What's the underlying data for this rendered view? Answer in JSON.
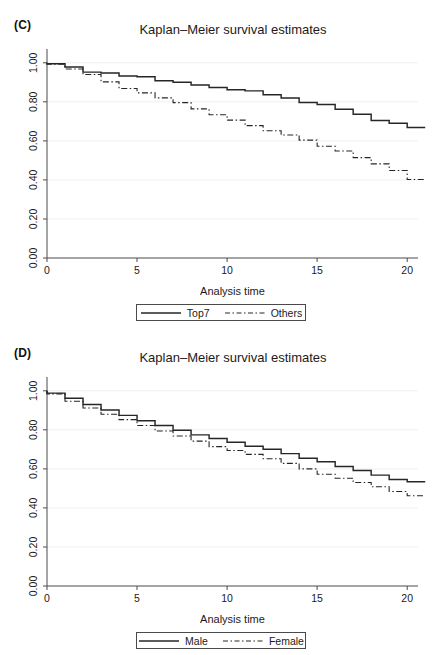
{
  "figure": {
    "background": "#ffffff",
    "line_color": "#262626",
    "grid_color": "#f0f0f0",
    "axis_color": "#4a4a4a"
  },
  "panels": [
    {
      "id": "C",
      "label": "(C)",
      "title": "Kaplan–Meier survival estimates",
      "legend": [
        {
          "label": "Top7",
          "style": "solid"
        },
        {
          "label": "Others",
          "style": "dashdot"
        }
      ]
    },
    {
      "id": "D",
      "label": "(D)",
      "title": "Kaplan–Meier survival estimates",
      "legend": [
        {
          "label": "Male",
          "style": "solid"
        },
        {
          "label": "Female",
          "style": "dashdot"
        }
      ]
    }
  ],
  "chart_data": [
    {
      "type": "line",
      "panel": "C",
      "title": "Kaplan–Meier survival estimates",
      "xlabel": "Analysis time",
      "ylabel": "",
      "xlim": [
        0,
        20.6
      ],
      "ylim": [
        0,
        1.05
      ],
      "xticks": [
        0,
        5,
        10,
        15,
        20
      ],
      "xtick_labels": [
        "0",
        "5",
        "10",
        "15",
        "20"
      ],
      "yticks": [
        0.0,
        0.2,
        0.4,
        0.6,
        0.8,
        1.0
      ],
      "ytick_labels": [
        "0.00",
        "0.20",
        "0.40",
        "0.60",
        "0.80",
        "1.00"
      ],
      "grid": "horizontal-faint",
      "legend_position": "below-axis-label",
      "step": "post",
      "series": [
        {
          "name": "Top7",
          "style": "solid",
          "x": [
            0,
            1,
            2,
            3,
            4,
            5,
            6,
            7,
            8,
            9,
            10,
            11,
            12,
            13,
            14,
            15,
            16,
            17,
            18,
            19,
            20
          ],
          "values": [
            1.0,
            0.995,
            0.978,
            0.952,
            0.948,
            0.932,
            0.928,
            0.908,
            0.9,
            0.886,
            0.873,
            0.862,
            0.856,
            0.836,
            0.82,
            0.797,
            0.786,
            0.762,
            0.736,
            0.704,
            0.69,
            0.668
          ]
        },
        {
          "name": "Others",
          "style": "dashdot",
          "x": [
            0,
            1,
            2,
            3,
            4,
            5,
            6,
            7,
            8,
            9,
            10,
            11,
            12,
            13,
            14,
            15,
            16,
            17,
            18,
            19,
            20
          ],
          "values": [
            1.0,
            0.993,
            0.968,
            0.94,
            0.902,
            0.868,
            0.846,
            0.82,
            0.796,
            0.764,
            0.734,
            0.706,
            0.678,
            0.652,
            0.63,
            0.604,
            0.572,
            0.548,
            0.514,
            0.482,
            0.448,
            0.402
          ]
        }
      ]
    },
    {
      "type": "line",
      "panel": "D",
      "title": "Kaplan–Meier survival estimates",
      "xlabel": "Analysis time",
      "ylabel": "",
      "xlim": [
        0,
        20.6
      ],
      "ylim": [
        0,
        1.05
      ],
      "xticks": [
        0,
        5,
        10,
        15,
        20
      ],
      "xtick_labels": [
        "0",
        "5",
        "10",
        "15",
        "20"
      ],
      "yticks": [
        0.0,
        0.2,
        0.4,
        0.6,
        0.8,
        1.0
      ],
      "ytick_labels": [
        "0.00",
        "0.20",
        "0.40",
        "0.60",
        "0.80",
        "1.00"
      ],
      "grid": "horizontal-faint",
      "legend_position": "below-axis-label",
      "step": "post",
      "series": [
        {
          "name": "Male",
          "style": "solid",
          "x": [
            0,
            1,
            2,
            3,
            4,
            5,
            6,
            7,
            8,
            9,
            10,
            11,
            12,
            13,
            14,
            15,
            16,
            17,
            18,
            19,
            20
          ],
          "values": [
            1.0,
            0.988,
            0.962,
            0.93,
            0.902,
            0.874,
            0.846,
            0.822,
            0.798,
            0.774,
            0.756,
            0.736,
            0.716,
            0.7,
            0.678,
            0.654,
            0.636,
            0.612,
            0.592,
            0.568,
            0.546,
            0.534
          ]
        },
        {
          "name": "Female",
          "style": "dashdot",
          "x": [
            0,
            1,
            2,
            3,
            4,
            5,
            6,
            7,
            8,
            9,
            10,
            11,
            12,
            13,
            14,
            15,
            16,
            17,
            18,
            19,
            20
          ],
          "values": [
            1.0,
            0.984,
            0.946,
            0.912,
            0.88,
            0.852,
            0.822,
            0.794,
            0.768,
            0.742,
            0.714,
            0.694,
            0.674,
            0.652,
            0.628,
            0.6,
            0.572,
            0.552,
            0.53,
            0.508,
            0.484,
            0.462
          ]
        }
      ]
    }
  ]
}
